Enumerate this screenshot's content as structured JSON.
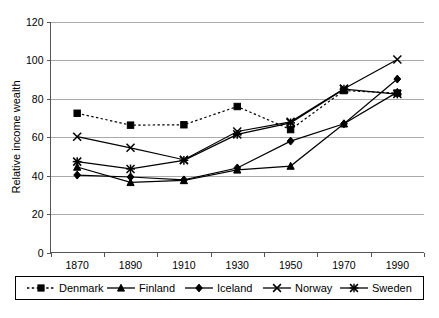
{
  "chart_data": {
    "type": "line",
    "title": "",
    "xlabel": "",
    "ylabel": "Relative income wealth",
    "categories": [
      "1870",
      "1890",
      "1910",
      "1930",
      "1950",
      "1970",
      "1990"
    ],
    "ylim": [
      0,
      120
    ],
    "y_ticks": [
      "0",
      "20",
      "40",
      "60",
      "80",
      "100",
      "120"
    ],
    "grid": "horizontal",
    "legend_position": "bottom",
    "series": [
      {
        "name": "Denmark",
        "marker": "square",
        "line_style": "dashed",
        "values": [
          72.5,
          66.3,
          66.5,
          76.0,
          64.0,
          84.3,
          83.0
        ]
      },
      {
        "name": "Finland",
        "marker": "triangle",
        "line_style": "solid",
        "values": [
          44.5,
          36.5,
          37.5,
          43.0,
          45.0,
          67.0,
          83.5
        ]
      },
      {
        "name": "Iceland",
        "marker": "diamond",
        "line_style": "solid",
        "values": [
          40.3,
          39.3,
          37.8,
          44.0,
          58.0,
          67.0,
          90.3
        ]
      },
      {
        "name": "Norway",
        "marker": "cross",
        "line_style": "solid",
        "values": [
          60.3,
          54.5,
          48.3,
          63.0,
          68.0,
          85.3,
          100.5
        ]
      },
      {
        "name": "Sweden",
        "marker": "star",
        "line_style": "solid",
        "values": [
          47.3,
          43.5,
          48.0,
          61.5,
          67.5,
          85.0,
          82.5
        ]
      }
    ]
  },
  "legend": {
    "items": [
      {
        "label": "Denmark"
      },
      {
        "label": "Finland"
      },
      {
        "label": "Iceland"
      },
      {
        "label": "Norway"
      },
      {
        "label": "Sweden"
      }
    ]
  }
}
